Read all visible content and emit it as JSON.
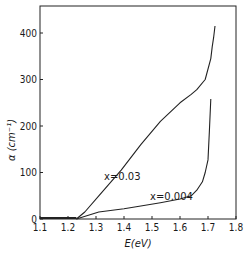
{
  "chart_data": {
    "type": "line",
    "title": "",
    "xlabel": "E(eV)",
    "ylabel": "α (cm⁻¹)",
    "xlim": [
      1.1,
      1.8
    ],
    "ylim": [
      0,
      450
    ],
    "xticks": [
      1.1,
      1.2,
      1.3,
      1.4,
      1.5,
      1.6,
      1.7,
      1.8
    ],
    "xtick_labels": [
      "1.1",
      "1.2",
      "1.3",
      "1.4",
      "1.5",
      "1.6",
      "1.7",
      "1.8"
    ],
    "yticks": [
      0,
      100,
      200,
      300,
      400
    ],
    "ytick_labels": [
      "0",
      "100",
      "200",
      "300",
      "400"
    ],
    "grid": false,
    "legend": "none",
    "series": [
      {
        "name": "x=0.03",
        "annotation": "x=0.03",
        "x": [
          1.23,
          1.26,
          1.31,
          1.39,
          1.46,
          1.53,
          1.6,
          1.64,
          1.66,
          1.69,
          1.71,
          1.715,
          1.72,
          1.725
        ],
        "y": [
          0,
          15,
          50,
          105,
          160,
          210,
          250,
          268,
          278,
          300,
          345,
          370,
          390,
          415
        ]
      },
      {
        "name": "x=0.004",
        "annotation": "x=0.004",
        "x": [
          1.23,
          1.31,
          1.4,
          1.46,
          1.53,
          1.6,
          1.64,
          1.66,
          1.68,
          1.69,
          1.7,
          1.705,
          1.71
        ],
        "y": [
          0,
          15,
          22,
          28,
          35,
          43,
          50,
          62,
          80,
          100,
          127,
          190,
          258
        ]
      }
    ]
  }
}
